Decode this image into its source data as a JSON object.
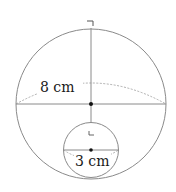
{
  "diagram": {
    "large_sphere": {
      "label": "8 cm",
      "measurement": "radius"
    },
    "small_sphere": {
      "label": "3 cm",
      "measurement": "radius"
    },
    "colors": {
      "stroke": "#8a8a8a",
      "dot": "#111111",
      "text": "#1a1a1a"
    }
  }
}
